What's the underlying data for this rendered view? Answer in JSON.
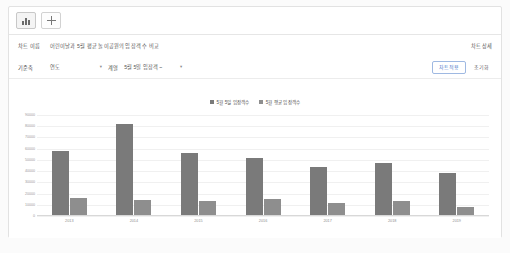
{
  "tabs": {
    "chart_tab_icon": "bar-chart-icon",
    "add_tab_icon": "plus-icon"
  },
  "form": {
    "title_label": "차트 이름",
    "title_value": "어린이날과 5월 평균 놀이공원의 입장객 수 비교",
    "detail_link": "차트 상세",
    "axis_label": "기준축",
    "axis_value": "연도",
    "series_label": "계열",
    "series_value": "5월 5일 입장객 ~",
    "caret": "▾",
    "apply_button": "차트적용",
    "reset_button": "초기화"
  },
  "chart_data": {
    "type": "bar",
    "title": "",
    "categories": [
      "2013",
      "2014",
      "2015",
      "2016",
      "2017",
      "2018",
      "2019"
    ],
    "series": [
      {
        "name": "5월 5일 입장객수",
        "color": "#7a7a7a",
        "values": [
          58000,
          82000,
          56000,
          52000,
          44000,
          47000,
          38000
        ]
      },
      {
        "name": "5월 평균 입장객수",
        "color": "#8e8e8e",
        "values": [
          16000,
          14000,
          13000,
          15000,
          12000,
          13000,
          8000
        ]
      }
    ],
    "xlabel": "",
    "ylabel": "",
    "ylim": [
      0,
      90000
    ],
    "yticks": [
      90000,
      80000,
      70000,
      60000,
      50000,
      40000,
      30000,
      20000,
      10000,
      0
    ],
    "grid": true,
    "legend_position": "top-center"
  }
}
